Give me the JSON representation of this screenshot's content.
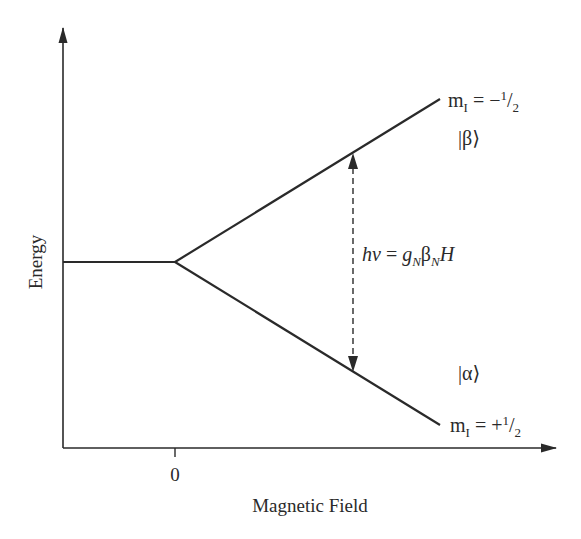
{
  "diagram": {
    "axes": {
      "y_label": "Energy",
      "x_label": "Magnetic Field",
      "x_tick_label": "0"
    },
    "levels": {
      "upper": {
        "state": "|β⟩",
        "m_label_prefix": "m",
        "m_label_sub": "I",
        "m_label_eq": " = −",
        "m_label_num": "1",
        "m_label_den": "2"
      },
      "lower": {
        "state": "|α⟩",
        "m_label_prefix": "m",
        "m_label_sub": "I",
        "m_label_eq": " = +",
        "m_label_num": "1",
        "m_label_den": "2"
      }
    },
    "transition": {
      "h": "h",
      "nu": "ν",
      "eq": " = ",
      "g": "g",
      "g_sub": "N",
      "beta": "β",
      "beta_sub": "N",
      "H": "H"
    },
    "colors": {
      "line": "#2a2a2a",
      "background": "#ffffff"
    }
  }
}
